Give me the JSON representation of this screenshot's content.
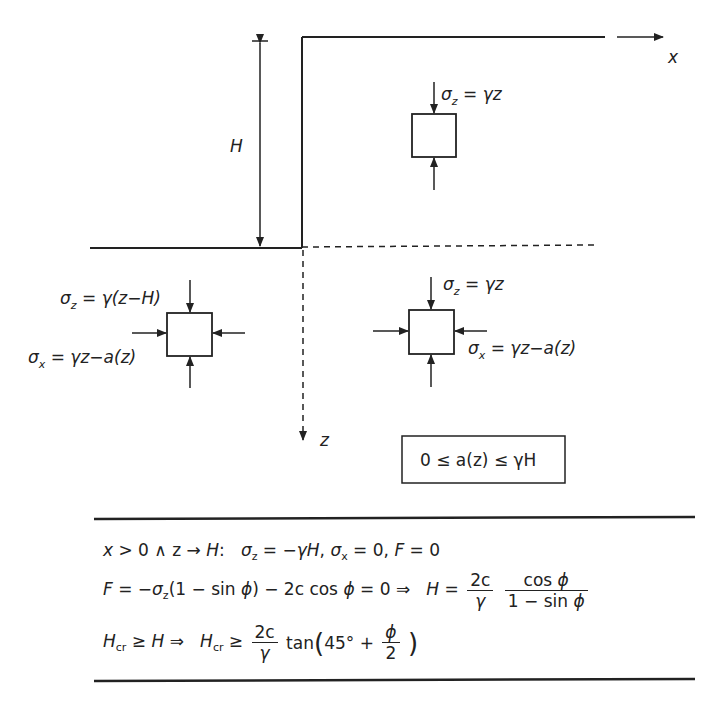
{
  "diagram": {
    "axes": {
      "x_label": "x",
      "z_label": "z"
    },
    "height_label": "H",
    "element_top": {
      "sigma_z": "σz = γz"
    },
    "element_left": {
      "sigma_z": "σz = γ(z−H)",
      "sigma_x": "σx = γz−a(z)"
    },
    "element_right": {
      "sigma_z": "σz = γz",
      "sigma_x": "σx = γz−a(z)"
    },
    "constraint_box": "0 ≤ a(z) ≤ γH"
  },
  "equations": {
    "line1": {
      "condition": "x > 0 ∧ z → H:",
      "result": "σz = −γH, σx = 0, F = 0"
    },
    "line2": {
      "lhs": "F = −σz(1 − sin ϕ) − 2c cos ϕ = 0 ⇒",
      "rhs_prefix": "H =",
      "frac1_num": "2c",
      "frac1_den": "γ",
      "frac2_num": "cos ϕ",
      "frac2_den": "1 − sin ϕ"
    },
    "line3": {
      "lhs": "Hcr ≥ H ⇒",
      "rhs_prefix": "Hcr ≥",
      "frac_num": "2c",
      "frac_den": "γ",
      "tan_part": "tan(45° +",
      "phi_num": "ϕ",
      "phi_den": "2",
      "close": ")"
    }
  }
}
